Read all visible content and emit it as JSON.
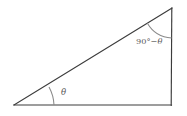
{
  "figure": {
    "type": "geometry-diagram",
    "canvas": {
      "width": 187,
      "height": 116,
      "background": "#ffffff"
    },
    "style": {
      "edge_color": "#3c3c3c",
      "arc_color": "#8a8a8a",
      "label_color": "#5a5a5a",
      "edge_width": 1.15,
      "arc_width": 1.05
    },
    "vertices": [
      {
        "id": "A",
        "name": "left-vertex",
        "x": 14,
        "y": 105
      },
      {
        "id": "B",
        "name": "bottom-right-vertex",
        "x": 171,
        "y": 105
      },
      {
        "id": "C",
        "name": "top-right-vertex",
        "x": 172,
        "y": 8
      }
    ],
    "edges": [
      {
        "id": "base",
        "name": "base-edge",
        "from": "A",
        "to": "B"
      },
      {
        "id": "vertical",
        "name": "vertical-edge",
        "from": "B",
        "to": "C"
      },
      {
        "id": "hypotenuse",
        "name": "hypotenuse-edge",
        "from": "A",
        "to": "C"
      }
    ],
    "angles": [
      {
        "id": "theta",
        "name": "angle-theta",
        "at_vertex": "A",
        "label": "θ",
        "label_x": 62,
        "label_y": 94,
        "arc_radius": 40,
        "arc_path": "M 54 105 A 40 40 0 0 1 51.6 89.7"
      },
      {
        "id": "complement",
        "name": "angle-90-minus-theta",
        "at_vertex": "C",
        "label_degrees": "90°",
        "label_minus": "−",
        "label_theta": "θ",
        "label_full": "90°−θ",
        "label_x": 136,
        "label_y": 44,
        "arc_radius": 29,
        "arc_path": "M 148.3 34.3 A 29 29 0 0 0 171.7 37"
      }
    ]
  }
}
